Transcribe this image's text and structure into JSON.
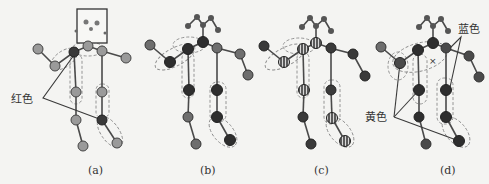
{
  "figure": {
    "panels": [
      {
        "id": "a",
        "caption": "(a)",
        "annotation": "红色"
      },
      {
        "id": "b",
        "caption": "(b)"
      },
      {
        "id": "c",
        "caption": "(c)"
      },
      {
        "id": "d",
        "caption": "(d)",
        "annotations": [
          "蓝色",
          "黄色"
        ],
        "marker": "×"
      }
    ]
  },
  "colors": {
    "background": "#f4f4f2",
    "joint_light": "#9a9a9a",
    "joint_mid": "#6e6e6e",
    "joint_dark": "#3a3a3a",
    "bone": "#4a4a4a",
    "group_outline": "#8a8a8a"
  }
}
